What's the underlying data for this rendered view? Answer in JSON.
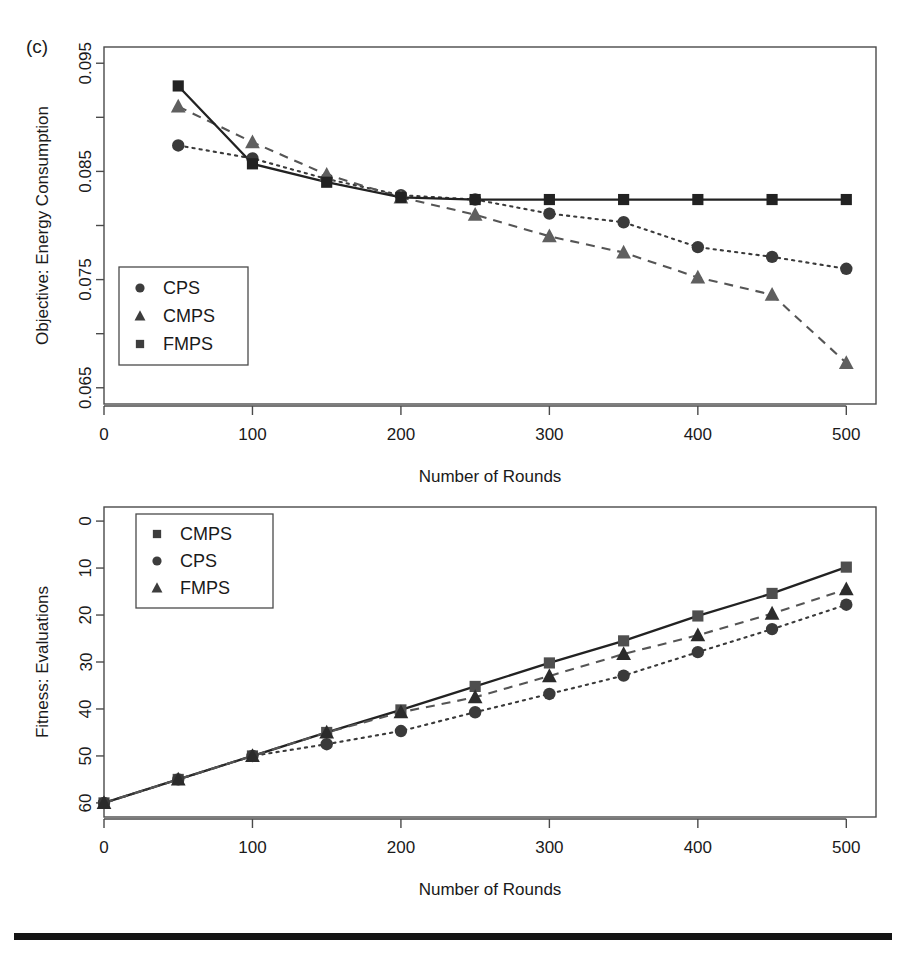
{
  "figure": {
    "panel_label": "(c)",
    "bottom_rule": true
  },
  "charts": [
    {
      "id": "top",
      "ylabel": "Objective: Energy Consumption",
      "xlabel": "Number of Rounds",
      "y_ticks_major": [
        "0.095",
        "0.085",
        "0.075",
        "0.065"
      ],
      "x_ticks": [
        "0",
        "100",
        "200",
        "300",
        "400",
        "500"
      ],
      "legend": [
        {
          "label": "CPS",
          "marker": "circle"
        },
        {
          "label": "CMPS",
          "marker": "triangle"
        },
        {
          "label": "FMPS",
          "marker": "square"
        }
      ]
    },
    {
      "id": "bottom",
      "ylabel": "Fitness: Evaluations",
      "xlabel": "Number of Rounds",
      "y_ticks_major": [
        "60",
        "50",
        "40",
        "30",
        "20",
        "10",
        "0"
      ],
      "x_ticks": [
        "0",
        "100",
        "200",
        "300",
        "400",
        "500"
      ],
      "legend": [
        {
          "label": "CMPS",
          "marker": "square"
        },
        {
          "label": "CPS",
          "marker": "circle"
        },
        {
          "label": "FMPS",
          "marker": "triangle"
        }
      ]
    }
  ],
  "chart_data": [
    {
      "type": "line",
      "id": "top",
      "title": "(c)",
      "xlabel": "Number of Rounds",
      "ylabel": "Objective: Energy Consumption",
      "xlim": [
        0,
        520
      ],
      "ylim": [
        0.0635,
        0.0965
      ],
      "x_ticks": [
        0,
        100,
        200,
        300,
        400,
        500
      ],
      "y_ticks": [
        0.065,
        0.07,
        0.075,
        0.08,
        0.085,
        0.09,
        0.095
      ],
      "y_tick_labels_shown": [
        0.095,
        0.085,
        0.075,
        0.065
      ],
      "grid": false,
      "legend_position": "left-middle",
      "x": [
        50,
        100,
        150,
        200,
        250,
        300,
        350,
        400,
        450,
        500
      ],
      "series": [
        {
          "name": "CPS",
          "marker": "circle",
          "linestyle": "dotted",
          "color": "#3a3a3a",
          "values": [
            0.0874,
            0.0862,
            0.0843,
            0.0828,
            0.0824,
            0.0811,
            0.0803,
            0.078,
            0.0771,
            0.076
          ]
        },
        {
          "name": "CMPS",
          "marker": "triangle",
          "linestyle": "dashed",
          "color": "#5f5f5f",
          "values": [
            0.091,
            0.0877,
            0.0847,
            0.0826,
            0.081,
            0.079,
            0.0775,
            0.0752,
            0.0736,
            0.0673
          ]
        },
        {
          "name": "FMPS",
          "marker": "square",
          "linestyle": "solid",
          "color": "#222222",
          "values": [
            0.0929,
            0.0857,
            0.084,
            0.0826,
            0.0824,
            0.0824,
            0.0824,
            0.0824,
            0.0824,
            0.0824
          ]
        }
      ]
    },
    {
      "type": "line",
      "id": "bottom",
      "title": "",
      "xlabel": "Number of Rounds",
      "ylabel": "Fitness: Evaluations",
      "xlim": [
        0,
        520
      ],
      "ylim": [
        -3,
        63
      ],
      "x_ticks": [
        0,
        100,
        200,
        300,
        400,
        500
      ],
      "y_ticks": [
        0,
        10,
        20,
        30,
        40,
        50,
        60
      ],
      "grid": false,
      "legend_position": "top-left",
      "x": [
        0,
        50,
        100,
        150,
        200,
        250,
        300,
        350,
        400,
        450,
        500
      ],
      "series": [
        {
          "name": "CMPS",
          "marker": "square",
          "linestyle": "solid",
          "color": "#4f4f4f",
          "values": [
            0,
            5,
            10,
            15,
            19.8,
            24.8,
            29.8,
            34.5,
            39.8,
            44.6,
            50.2
          ]
        },
        {
          "name": "CPS",
          "marker": "circle",
          "linestyle": "dotted",
          "color": "#3a3a3a",
          "values": [
            0,
            5,
            10,
            12.5,
            15.3,
            19.3,
            23.2,
            27.1,
            32.1,
            37.0,
            42.2
          ]
        },
        {
          "name": "FMPS",
          "marker": "triangle",
          "linestyle": "dashed",
          "color": "#2b2b2b",
          "values": [
            0,
            5,
            10,
            15,
            19.3,
            22.5,
            27.0,
            31.7,
            35.7,
            40.3,
            45.5
          ]
        }
      ]
    }
  ]
}
